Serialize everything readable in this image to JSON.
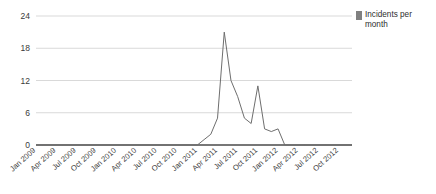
{
  "legend": {
    "label": "Incidents per month",
    "swatch_color": "#808080",
    "position": "right"
  },
  "axis": {
    "y_ticks": [
      "0",
      "6",
      "12",
      "18",
      "24"
    ],
    "x_ticks": [
      "Jan 2009",
      "Apr 2009",
      "Jul 2009",
      "Oct 2009",
      "Jan 2010",
      "Apr 2010",
      "Jul 2010",
      "Oct 2010",
      "Jan 2011",
      "Apr 2011",
      "Jul 2011",
      "Oct 2011",
      "Jan 2012",
      "Apr 2012",
      "Jul 2012",
      "Oct 2012"
    ]
  },
  "colors": {
    "line": "#6e6e6e",
    "grid": "#d9d9d9",
    "axis": "#4a4a4a",
    "text": "#3a3a3a",
    "background": "#ffffff"
  },
  "chart_data": {
    "type": "line",
    "title": "",
    "xlabel": "",
    "ylabel": "",
    "ylim": [
      0,
      24
    ],
    "yticks": [
      0,
      6,
      12,
      18,
      24
    ],
    "grid": true,
    "legend_position": "right",
    "categories": [
      "Jan 2009",
      "Feb 2009",
      "Mar 2009",
      "Apr 2009",
      "May 2009",
      "Jun 2009",
      "Jul 2009",
      "Aug 2009",
      "Sep 2009",
      "Oct 2009",
      "Nov 2009",
      "Dec 2009",
      "Jan 2010",
      "Feb 2010",
      "Mar 2010",
      "Apr 2010",
      "May 2010",
      "Jun 2010",
      "Jul 2010",
      "Aug 2010",
      "Sep 2010",
      "Oct 2010",
      "Nov 2010",
      "Dec 2010",
      "Jan 2011",
      "Feb 2011",
      "Mar 2011",
      "Apr 2011",
      "May 2011",
      "Jun 2011",
      "Jul 2011",
      "Aug 2011",
      "Sep 2011",
      "Oct 2011",
      "Nov 2011",
      "Dec 2011",
      "Jan 2012",
      "Feb 2012",
      "Mar 2012",
      "Apr 2012",
      "May 2012",
      "Jun 2012",
      "Jul 2012",
      "Aug 2012",
      "Sep 2012",
      "Oct 2012",
      "Nov 2012",
      "Dec 2012"
    ],
    "series": [
      {
        "name": "Incidents per month",
        "values": [
          0,
          0,
          0,
          0,
          0,
          0,
          0,
          0,
          0,
          0,
          0,
          0,
          0,
          0,
          0,
          0,
          0,
          0,
          0,
          0,
          0,
          0,
          0,
          0,
          0,
          1,
          2,
          5,
          21,
          12,
          9,
          5,
          4,
          11,
          3,
          2.5,
          3,
          0,
          0,
          0,
          0,
          0,
          0,
          0,
          0,
          0,
          0,
          0
        ]
      }
    ]
  }
}
